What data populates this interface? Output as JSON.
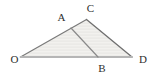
{
  "diagram": {
    "background_color": "#ffffff",
    "fill_color": "#f2f1ee",
    "stripe_color": "#e7e6e3",
    "label_color": "#2e2e2e",
    "label_font_size": 11,
    "points": {
      "O": {
        "x": 20.5,
        "y": 57,
        "label": "O",
        "label_x": 14.5,
        "label_y": 58.5
      },
      "A": {
        "x": 71,
        "y": 28,
        "label": "A",
        "label_x": 61.5,
        "label_y": 17
      },
      "C": {
        "x": 86.5,
        "y": 19.5,
        "label": "C",
        "label_x": 90.5,
        "label_y": 8
      },
      "B": {
        "x": 98,
        "y": 57,
        "label": "B",
        "label_x": 102,
        "label_y": 68
      },
      "D": {
        "x": 132,
        "y": 57,
        "label": "D",
        "label_x": 143,
        "label_y": 58.5
      }
    },
    "filled_polygon": [
      "O",
      "C",
      "D"
    ],
    "segments": [
      {
        "from": "O",
        "to": "C",
        "color": "#7a7a7a",
        "width": 1.2
      },
      {
        "from": "C",
        "to": "D",
        "color": "#6f6f6f",
        "width": 1.3
      },
      {
        "from": "O",
        "to": "D",
        "color": "#b5b5b5",
        "width": 1.8
      },
      {
        "from": "A",
        "to": "B",
        "color": "#8a8a8a",
        "width": 1.2
      }
    ]
  }
}
